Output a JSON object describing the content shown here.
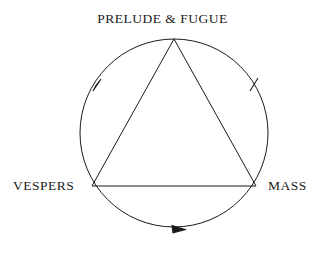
{
  "diagram": {
    "type": "cycle-triangle-in-circle",
    "background_color": "#ffffff",
    "stroke_color": "#1a1a1a",
    "nodes": {
      "top": "PRELUDE & FUGUE",
      "left": "VESPERS",
      "right": "MASS"
    },
    "geometry": {
      "circle": {
        "cx": 174,
        "cy": 133,
        "r": 94
      },
      "triangle": {
        "apex": {
          "x": 174,
          "y": 39
        },
        "left": {
          "x": 92,
          "y": 186
        },
        "right": {
          "x": 256,
          "y": 186
        }
      }
    },
    "arrows": [
      {
        "name": "arrow-left-arc",
        "direction": "counterclockwise",
        "position": "upper-left"
      },
      {
        "name": "arrow-right-arc",
        "direction": "counterclockwise",
        "position": "upper-right"
      },
      {
        "name": "arrow-bottom-arc",
        "direction": "counterclockwise",
        "position": "bottom"
      }
    ]
  }
}
